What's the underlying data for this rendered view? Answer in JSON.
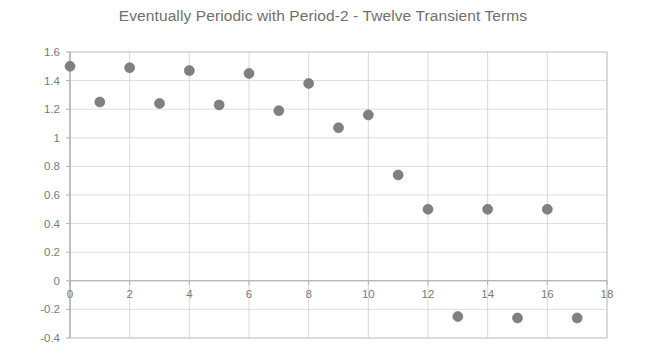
{
  "chart_data": {
    "type": "scatter",
    "title": "Eventually Periodic with Period-2 - Twelve Transient Terms",
    "xlabel": "",
    "ylabel": "",
    "xlim": [
      0,
      18
    ],
    "ylim": [
      -0.4,
      1.6
    ],
    "grid": true,
    "legend": false,
    "marker_color": "#808080",
    "x": [
      0,
      1,
      2,
      3,
      4,
      5,
      6,
      7,
      8,
      9,
      10,
      11,
      12,
      13,
      14,
      15,
      16,
      17
    ],
    "values": [
      1.5,
      1.25,
      1.49,
      1.24,
      1.47,
      1.23,
      1.45,
      1.19,
      1.38,
      1.07,
      1.16,
      0.74,
      0.5,
      -0.25,
      0.5,
      -0.26,
      0.5,
      -0.26
    ],
    "series": [
      {
        "name": "sequence",
        "values": [
          1.5,
          1.25,
          1.49,
          1.24,
          1.47,
          1.23,
          1.45,
          1.19,
          1.38,
          1.07,
          1.16,
          0.74,
          0.5,
          -0.25,
          0.5,
          -0.26,
          0.5,
          -0.26
        ]
      }
    ],
    "x_ticks": [
      0,
      2,
      4,
      6,
      8,
      10,
      12,
      14,
      16,
      18
    ],
    "x_tick_labels": [
      "0",
      "2",
      "4",
      "6",
      "8",
      "10",
      "12",
      "14",
      "16",
      "18"
    ],
    "y_ticks": [
      -0.4,
      -0.2,
      0,
      0.2,
      0.4,
      0.6,
      0.8,
      1.0,
      1.2,
      1.4,
      1.6
    ],
    "y_tick_labels": [
      "-0.4",
      "-0.2",
      "0",
      "0.2",
      "0.4",
      "0.6",
      "0.8",
      "1",
      "1.2",
      "1.4",
      "1.6"
    ]
  }
}
